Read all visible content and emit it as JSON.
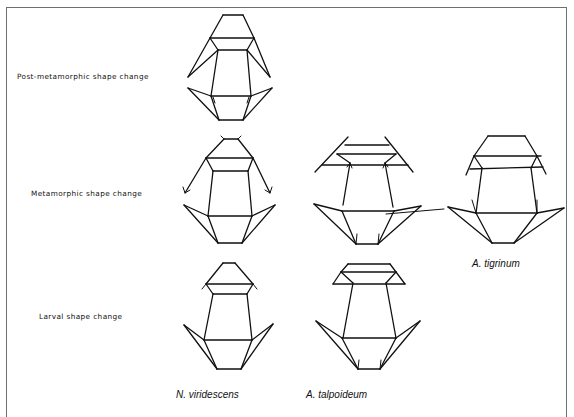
{
  "figure": {
    "rows": [
      {
        "id": "post-metamorphic",
        "label": "Post-metamorphic shape change"
      },
      {
        "id": "metamorphic",
        "label": "Metamorphic shape change"
      },
      {
        "id": "larval",
        "label": "Larval shape change"
      }
    ],
    "species": [
      {
        "id": "n-viridescens",
        "label": "N. viridescens"
      },
      {
        "id": "a-talpoideum",
        "label": "A. talpoideum"
      },
      {
        "id": "a-tigrinum",
        "label": "A. tigrinum"
      }
    ],
    "panels": [
      {
        "row": "post-metamorphic",
        "species": "N. viridescens"
      },
      {
        "row": "metamorphic",
        "species": "N. viridescens"
      },
      {
        "row": "metamorphic",
        "species": "A. talpoideum"
      },
      {
        "row": "metamorphic",
        "species": "A. tigrinum"
      },
      {
        "row": "larval",
        "species": "N. viridescens"
      },
      {
        "row": "larval",
        "species": "A. talpoideum"
      }
    ],
    "colors": {
      "line": "#111111",
      "frame": "#6f6f6f",
      "background": "#ffffff"
    }
  }
}
